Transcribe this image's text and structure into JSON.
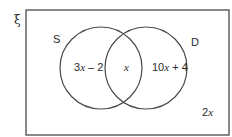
{
  "diagram": {
    "type": "venn",
    "universal_symbol": "ξ",
    "sets": [
      {
        "name": "S",
        "label": "S"
      },
      {
        "name": "D",
        "label": "D"
      }
    ],
    "regions": {
      "s_only": {
        "coef": "3",
        "var": "x",
        "rest": " – 2"
      },
      "intersection": {
        "var": "x"
      },
      "d_only": {
        "coef": "10",
        "var": "x",
        "rest": " + 4"
      },
      "outside": {
        "coef": "2",
        "var": "x"
      }
    }
  }
}
